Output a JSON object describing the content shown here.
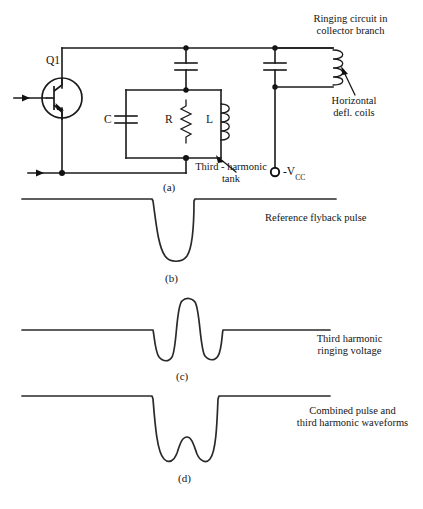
{
  "figure": {
    "title_note_top": "Ringing circuit in\ncollector branch",
    "panels": [
      {
        "id": "a",
        "caption": "(a)",
        "description": "transistor ringing circuit schematic"
      },
      {
        "id": "b",
        "caption": "(b)",
        "description": "reference flyback pulse waveform"
      },
      {
        "id": "c",
        "caption": "(c)",
        "description": "third harmonic ringing voltage waveform"
      },
      {
        "id": "d",
        "caption": "(d)",
        "description": "combined pulse and third harmonic waveform"
      }
    ]
  },
  "circuit": {
    "transistor_label": "Q1",
    "components": [
      {
        "name": "C",
        "label": "C",
        "type": "capacitor"
      },
      {
        "name": "R",
        "label": "R",
        "type": "resistor"
      },
      {
        "name": "L",
        "label": "L",
        "type": "inductor"
      }
    ],
    "supply_label_prefix": "-V",
    "supply_label_sub": "CC",
    "annotations": {
      "ringing_circuit": {
        "line1": "Ringing circuit in",
        "line2": "collector branch"
      },
      "horizontal_coils": {
        "line1": "Horizontal",
        "line2": "defl. coils"
      },
      "third_harmonic_tank": {
        "line1": "Third - harmonic",
        "line2": "tank"
      }
    }
  },
  "waveforms": {
    "b": {
      "caption": "(b)",
      "label": "Reference flyback pulse",
      "path": "M 22 199 L 152 199 L 153 201 C 156 222 158 246 165 256 C 170 263 182 263 187 256 C 193 247 194 220 194 201 L 195 199 L 336 199"
    },
    "c": {
      "caption": "(c)",
      "label_line1": "Third harmonic",
      "label_line2": "ringing voltage",
      "path": "M 22 330 L 153 330 C 154 333 155 352 159 357 C 163 362 169 362 172 357 C 177 349 176 306 182 301 C 186 297 192 298 195 302 C 200 309 200 350 205 356 C 209 361 215 361 218 356 C 222 350 222 333 223 330 L 330 330"
    },
    "d": {
      "caption": "(d)",
      "label_line1": "Combined pulse and",
      "label_line2": "third harmonic waveforms",
      "path": "M 22 396 L 152 396 L 153 399 C 155 424 157 452 164 459 C 169 464 174 461 177 453 C 180 444 182 437 187 437 C 192 437 194 446 197 454 C 200 461 206 464 210 459 C 216 452 217 424 218 399 L 219 396 L 330 396"
    }
  },
  "colors": {
    "ink": "#1a1a1a",
    "trace": "#2a2a2a",
    "background": "#ffffff"
  }
}
